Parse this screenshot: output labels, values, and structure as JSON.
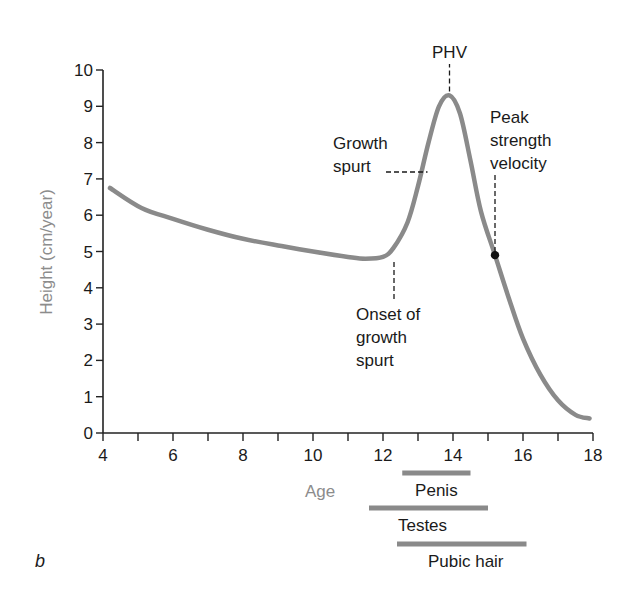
{
  "chart_data": {
    "type": "line",
    "title": "",
    "panel_label": "b",
    "xlabel": "Age",
    "ylabel": "Height (cm/year)",
    "xlim": [
      4,
      18
    ],
    "ylim": [
      0,
      10
    ],
    "x_ticks": [
      4,
      6,
      8,
      10,
      12,
      14,
      16,
      18
    ],
    "x_minor_ticks": [
      5,
      7,
      9,
      11,
      13,
      15,
      17
    ],
    "y_ticks": [
      0,
      1,
      2,
      3,
      4,
      5,
      6,
      7,
      8,
      9,
      10
    ],
    "grid": false,
    "series": [
      {
        "name": "Height velocity",
        "color": "#8a8a8a",
        "x": [
          4.2,
          5.1,
          6.0,
          7.0,
          8.0,
          9.1,
          10.0,
          11.0,
          11.5,
          12.0,
          12.3,
          12.7,
          13.0,
          13.3,
          13.6,
          13.9,
          14.2,
          14.5,
          14.8,
          15.2,
          15.6,
          16.0,
          16.5,
          17.0,
          17.5,
          17.9
        ],
        "values": [
          6.75,
          6.2,
          5.9,
          5.6,
          5.35,
          5.15,
          5.0,
          4.85,
          4.8,
          4.85,
          5.1,
          5.8,
          6.8,
          8.0,
          9.0,
          9.3,
          8.8,
          7.5,
          6.1,
          4.9,
          3.7,
          2.6,
          1.6,
          0.9,
          0.5,
          0.4
        ]
      }
    ],
    "annotations": [
      {
        "id": "phv",
        "lines": [
          "PHV"
        ],
        "x": 13.9,
        "y": 9.3
      },
      {
        "id": "growth-spurt",
        "lines": [
          "Growth",
          "spurt"
        ],
        "x": 13.3,
        "y": 7.3
      },
      {
        "id": "peak-strength-velocity",
        "lines": [
          "Peak",
          "strength",
          "velocity"
        ],
        "x": 15.2,
        "y": 4.9,
        "marker": "dot"
      },
      {
        "id": "onset-growth-spurt",
        "lines": [
          "Onset of",
          "growth",
          "spurt"
        ],
        "x": 12.3,
        "y": 4.8
      }
    ],
    "maturation_bars": [
      {
        "label": "Penis",
        "start": 12.55,
        "end": 14.5
      },
      {
        "label": "Testes",
        "start": 11.6,
        "end": 15.0
      },
      {
        "label": "Pubic hair",
        "start": 12.4,
        "end": 16.1
      }
    ]
  },
  "colors": {
    "curve": "#8a8a8a",
    "axis": "#222222",
    "axis_title": "#8c8c8c",
    "text": "#1a1a1a",
    "bar": "#8a8a8a"
  }
}
